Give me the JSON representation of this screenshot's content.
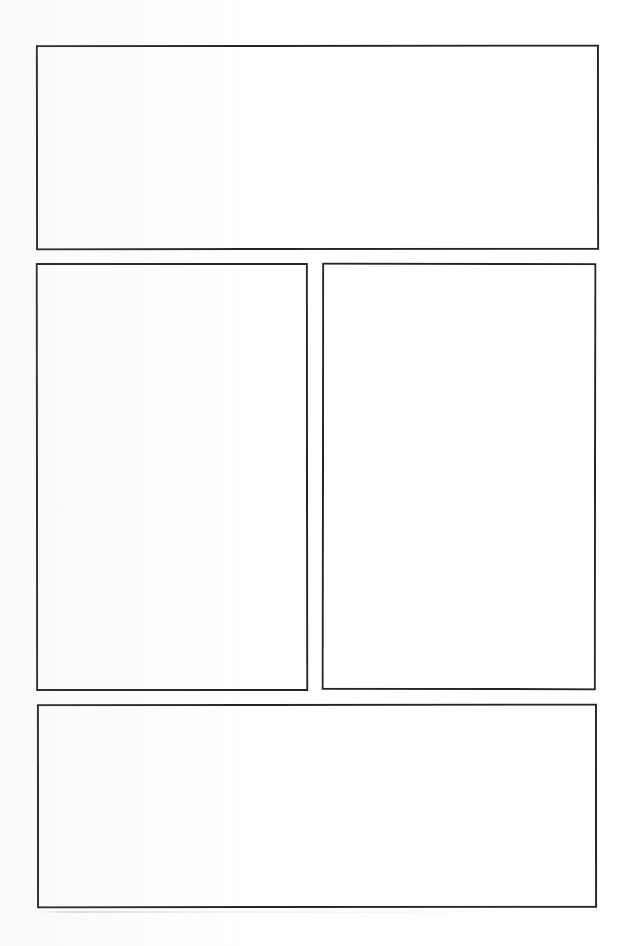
{
  "page": {
    "width": 628,
    "height": 946,
    "background_color": "#ffffff",
    "ink_color": "#252525",
    "paper_texture": "faint-scan-grain"
  },
  "layout": {
    "kind": "comic-page-grid",
    "rows": 3,
    "panel_count": 4,
    "gutter_horizontal_px": 13,
    "gutter_vertical_px": 13,
    "margin_left_px": 36,
    "margin_right_px": 30,
    "margin_top_px": 45,
    "margin_bottom_px": 38
  },
  "panels": [
    {
      "id": "panel-1",
      "name": "top-wide-panel",
      "row": 1,
      "index_in_row": 1,
      "x": 36,
      "y": 45,
      "width": 563,
      "height": 205,
      "border_width_px": 2.5,
      "border_color": "#252525",
      "fill_color": "#ffffff",
      "content": "",
      "empty": true
    },
    {
      "id": "panel-2",
      "name": "middle-left-panel",
      "row": 2,
      "index_in_row": 1,
      "x": 36,
      "y": 263,
      "width": 272,
      "height": 428,
      "border_width_px": 2.5,
      "border_color": "#252525",
      "fill_color": "#ffffff",
      "content": "",
      "empty": true
    },
    {
      "id": "panel-3",
      "name": "middle-right-panel",
      "row": 2,
      "index_in_row": 2,
      "x": 322,
      "y": 263,
      "width": 274,
      "height": 427,
      "border_width_px": 2.5,
      "border_color": "#252525",
      "fill_color": "#ffffff",
      "content": "",
      "empty": true
    },
    {
      "id": "panel-4",
      "name": "bottom-wide-panel",
      "row": 3,
      "index_in_row": 1,
      "x": 37,
      "y": 704,
      "width": 560,
      "height": 204,
      "border_width_px": 2.5,
      "border_color": "#252525",
      "fill_color": "#ffffff",
      "content": "",
      "empty": true
    }
  ]
}
